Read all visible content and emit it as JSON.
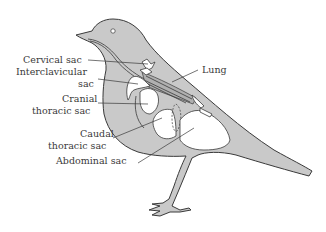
{
  "diagram": {
    "colors": {
      "body_fill": "#c9c9c9",
      "sac_fill": "#ffffff",
      "line": "#3a3a3a",
      "background": "#ffffff"
    },
    "labels": {
      "cervical_sac": "Cervical sac",
      "interclavicular_line1": "Interclavicular",
      "interclavicular_line2": "sac",
      "cranial_line1": "Cranial",
      "cranial_line2": "thoracic sac",
      "caudal_line1": "Caudal",
      "caudal_line2": "thoracic sac",
      "abdominal_sac": "Abdominal sac",
      "lung": "Lung"
    }
  }
}
